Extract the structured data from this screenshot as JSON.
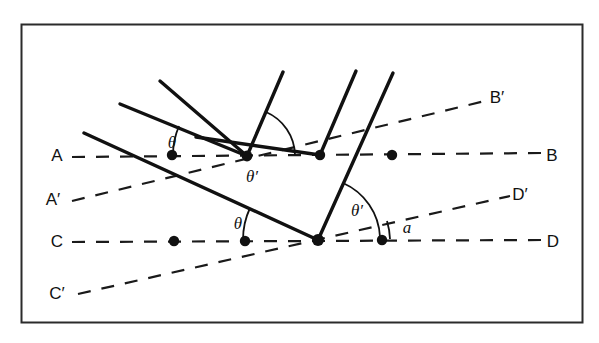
{
  "figure": {
    "type": "optics-reflection-diagram",
    "frame": {
      "x": 21,
      "y": 24,
      "width": 562,
      "height": 299,
      "stroke": "#2b2b2b",
      "stroke_width": 2
    },
    "colors": {
      "ink": "#111111",
      "solid_line": "#111111",
      "dashed_line": "#1a1a1a",
      "frame": "#2b2b2b",
      "background": "#ffffff"
    },
    "labels": {
      "A": "A",
      "A_prime": "A′",
      "B": "B",
      "B_prime": "B′",
      "C": "C",
      "C_prime": "C′",
      "D": "D",
      "D_prime": "D′",
      "theta_upper": "θ",
      "theta_prime_upper": "θ′",
      "theta_lower": "θ",
      "theta_prime_lower": "θ′",
      "alpha": "a"
    },
    "label_positions": {
      "A": {
        "x": 57,
        "y": 161
      },
      "A_prime": {
        "x": 53,
        "y": 205
      },
      "B": {
        "x": 552,
        "y": 161
      },
      "B_prime": {
        "x": 497,
        "y": 103
      },
      "C": {
        "x": 57,
        "y": 247
      },
      "C_prime": {
        "x": 57,
        "y": 299
      },
      "D": {
        "x": 553,
        "y": 247
      },
      "D_prime": {
        "x": 520,
        "y": 200
      },
      "theta_upper": {
        "x": 172,
        "y": 148
      },
      "theta_prime_upper": {
        "x": 249,
        "y": 180
      },
      "theta_lower": {
        "x": 238,
        "y": 229
      },
      "theta_prime_lower": {
        "x": 355,
        "y": 215
      },
      "alpha": {
        "x": 407,
        "y": 233
      }
    },
    "reference_lines": [
      {
        "name": "A-B",
        "x1": 72,
        "y1": 157,
        "x2": 543,
        "y2": 153,
        "style": "dashed"
      },
      {
        "name": "A'-B'",
        "x1": 72,
        "y1": 201,
        "x2": 489,
        "y2": 100,
        "style": "dashed"
      },
      {
        "name": "C-D",
        "x1": 72,
        "y1": 242,
        "x2": 543,
        "y2": 240,
        "style": "dashed"
      },
      {
        "name": "C'-D'",
        "x1": 78,
        "y1": 294,
        "x2": 510,
        "y2": 196,
        "style": "dashed"
      }
    ],
    "surface_segments": [
      {
        "name": "upper-facet",
        "x1": 120,
        "y1": 104,
        "x2": 247,
        "y2": 156
      },
      {
        "name": "mid-facet",
        "x1": 196,
        "y1": 137,
        "x2": 320,
        "y2": 155
      },
      {
        "name": "lower-facet",
        "x1": 84,
        "y1": 133,
        "x2": 318,
        "y2": 240
      }
    ],
    "incident_rays": [
      {
        "name": "incident-ray-1",
        "x1": 120,
        "y1": 104,
        "x2": 247,
        "y2": 156
      },
      {
        "name": "incident-ray-2",
        "x1": 160,
        "y1": 81,
        "x2": 247,
        "y2": 156
      },
      {
        "name": "incident-ray-3",
        "x1": 84,
        "y1": 133,
        "x2": 318,
        "y2": 240
      }
    ],
    "reflected_rays": [
      {
        "name": "reflected-ray-1",
        "x1": 247,
        "y1": 156,
        "x2": 283,
        "y2": 72
      },
      {
        "name": "reflected-ray-2",
        "x1": 320,
        "y1": 155,
        "x2": 356,
        "y2": 71
      },
      {
        "name": "reflected-ray-3",
        "x1": 318,
        "y1": 240,
        "x2": 393,
        "y2": 73
      }
    ],
    "points": [
      {
        "name": "point-on-AB-1",
        "x": 172,
        "y": 155,
        "r": 5
      },
      {
        "name": "vertex-upper",
        "x": 247,
        "y": 156,
        "r": 5
      },
      {
        "name": "vertex-mid",
        "x": 320,
        "y": 155,
        "r": 5
      },
      {
        "name": "point-on-AB-2",
        "x": 392,
        "y": 155,
        "r": 5
      },
      {
        "name": "point-on-CD-1",
        "x": 174,
        "y": 241,
        "r": 5
      },
      {
        "name": "point-on-CD-2",
        "x": 245,
        "y": 241,
        "r": 5
      },
      {
        "name": "vertex-lower",
        "x": 318,
        "y": 240,
        "r": 6
      },
      {
        "name": "point-on-CD-3",
        "x": 382,
        "y": 240,
        "r": 5
      }
    ],
    "angle_arcs": [
      {
        "name": "arc-theta-upper",
        "cx": 247,
        "cy": 156,
        "r": 74,
        "start_deg": 180,
        "end_deg": 203
      },
      {
        "name": "arc-theta-prime-upper",
        "cx": 247,
        "cy": 156,
        "r": 48,
        "start_deg": 293,
        "end_deg": 359
      },
      {
        "name": "arc-theta-lower",
        "cx": 318,
        "cy": 240,
        "r": 75,
        "start_deg": 180,
        "end_deg": 205
      },
      {
        "name": "arc-theta-prime-lower",
        "cx": 318,
        "cy": 240,
        "r": 62,
        "start_deg": 294,
        "end_deg": 357
      },
      {
        "name": "arc-alpha",
        "cx": 318,
        "cy": 240,
        "r": 72,
        "start_deg": 345,
        "end_deg": 359
      }
    ]
  }
}
